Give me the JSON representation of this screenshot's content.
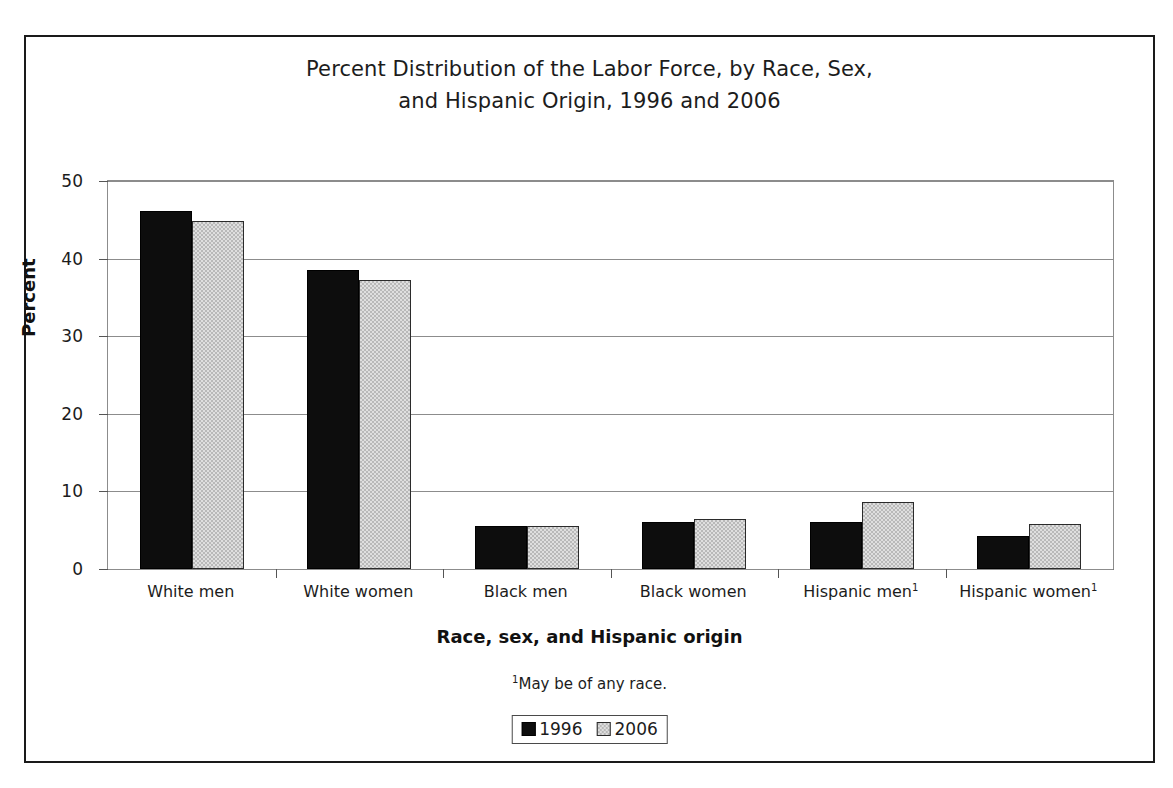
{
  "chart_data": {
    "type": "bar",
    "title": "Percent Distribution of the Labor Force, by Race, Sex, and Hispanic Origin, 1996 and 2006",
    "title_lines": [
      "Percent Distribution of the Labor Force, by Race, Sex,",
      "and Hispanic Origin, 1996 and 2006"
    ],
    "xlabel": "Race, sex, and Hispanic origin",
    "ylabel": "Percent",
    "ylim": [
      0,
      50
    ],
    "yticks": [
      0,
      10,
      20,
      30,
      40,
      50
    ],
    "ytick_labels": [
      "0",
      "10",
      "20",
      "30",
      "40",
      "50"
    ],
    "grid": true,
    "legend_position": "bottom-center",
    "categories": [
      "White men",
      "White women",
      "Black men",
      "Black women",
      "Hispanic men",
      "Hispanic women"
    ],
    "category_footnote_marks": [
      "",
      "",
      "",
      "",
      "1",
      "1"
    ],
    "series": [
      {
        "name": "1996",
        "color": "#0d0d0d",
        "values": [
          46.2,
          38.5,
          5.6,
          6.1,
          6.0,
          4.2
        ]
      },
      {
        "name": "2006",
        "color": "#b9b9b9",
        "values": [
          44.8,
          37.3,
          5.6,
          6.4,
          8.6,
          5.8
        ]
      }
    ],
    "annotations": [
      "1May be of any race."
    ],
    "footnote": "May be of any race.",
    "footnote_mark": "1"
  },
  "legend": {
    "items": [
      {
        "label": "1996",
        "swatch": "black-square-swatch"
      },
      {
        "label": "2006",
        "swatch": "gray-square-swatch"
      }
    ]
  }
}
